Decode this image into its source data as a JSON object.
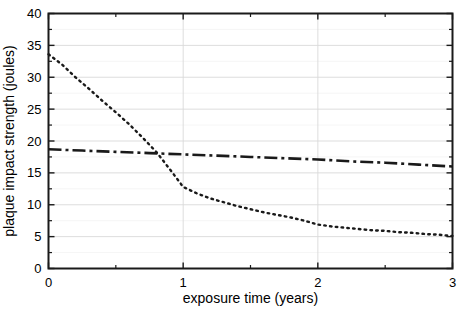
{
  "chart_data": {
    "type": "line",
    "title": "",
    "xlabel": "exposure time (years)",
    "ylabel": "plaque impact strength (joules)",
    "xlim": [
      0,
      3
    ],
    "ylim": [
      0,
      40
    ],
    "xticks": [
      0,
      1,
      2,
      3
    ],
    "xtick_labels": [
      "0",
      "1",
      "2",
      "3"
    ],
    "xminor_ticks": [
      0.5,
      1.5,
      2.5
    ],
    "yticks": [
      0,
      5,
      10,
      15,
      20,
      25,
      30,
      35,
      40
    ],
    "ytick_labels": [
      "0",
      "5",
      "10",
      "15",
      "20",
      "25",
      "30",
      "35",
      "40"
    ],
    "yminor_ticks": [
      2.5,
      7.5,
      12.5,
      17.5,
      22.5,
      27.5,
      32.5,
      37.5
    ],
    "grid": true,
    "grid_color": "#d9d9d9",
    "legend": "none",
    "series": [
      {
        "name": "dotted-series",
        "style": "dotted",
        "color": "#1a1a1a",
        "x": [
          0.0,
          0.1,
          0.2,
          0.3,
          0.4,
          0.5,
          0.6,
          0.7,
          0.8,
          0.9,
          1.0,
          1.1,
          1.2,
          1.3,
          1.4,
          1.5,
          1.6,
          1.7,
          1.8,
          1.9,
          2.0,
          2.1,
          2.2,
          2.3,
          2.4,
          2.5,
          2.6,
          2.7,
          2.8,
          2.9,
          3.0
        ],
        "y": [
          33.6,
          32.0,
          30.0,
          28.2,
          26.3,
          24.5,
          22.6,
          20.5,
          18.3,
          15.6,
          12.8,
          11.8,
          11.0,
          10.4,
          9.8,
          9.3,
          8.8,
          8.4,
          8.0,
          7.5,
          6.9,
          6.6,
          6.4,
          6.2,
          6.0,
          5.9,
          5.7,
          5.6,
          5.4,
          5.3,
          5.1
        ]
      },
      {
        "name": "dash-dot-series",
        "style": "dash-dot",
        "color": "#1a1a1a",
        "x": [
          0.0,
          0.25,
          0.5,
          0.75,
          1.0,
          1.25,
          1.5,
          1.75,
          2.0,
          2.25,
          2.5,
          2.75,
          3.0
        ],
        "y": [
          18.7,
          18.5,
          18.3,
          18.1,
          17.9,
          17.7,
          17.5,
          17.3,
          17.1,
          16.8,
          16.6,
          16.3,
          16.0
        ]
      }
    ]
  },
  "axes": {
    "x_title": "exposure time (years)",
    "y_title": "plaque impact strength (joules)"
  }
}
